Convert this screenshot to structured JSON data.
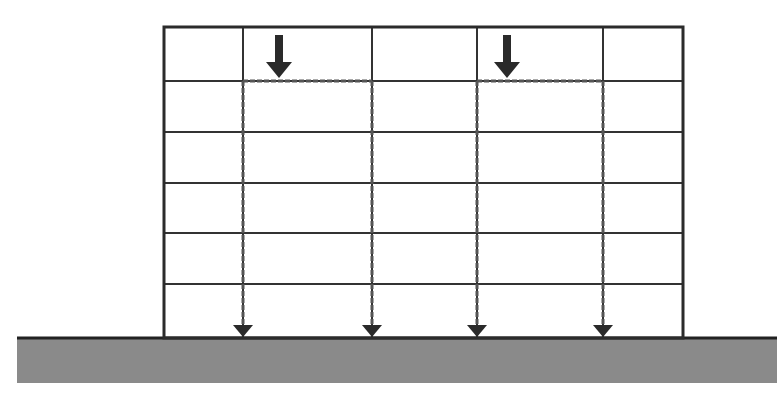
{
  "diagram": {
    "type": "structural-load-path",
    "canvas": {
      "width": 777,
      "height": 393,
      "background": "#ffffff"
    },
    "colors": {
      "frame": "#2b2b2b",
      "grid": "#333333",
      "load_path": "#555555",
      "arrow": "#2a2a2a",
      "ground_fill": "#8a8a8a",
      "ground_edge": "#222222"
    },
    "frame": {
      "left": 164,
      "right": 683,
      "top": 27,
      "bottom": 338,
      "stroke": 3
    },
    "columns_x": [
      243,
      372,
      477,
      603
    ],
    "floors_y": [
      81,
      132,
      183,
      233,
      284
    ],
    "ground": {
      "x": 17,
      "y": 338,
      "width": 760,
      "height": 45,
      "edge": 3
    },
    "top_loads": [
      {
        "x": 279,
        "y_start": 35,
        "y_end": 78,
        "label": "load-arrow-left"
      },
      {
        "x": 507,
        "y_start": 35,
        "y_end": 78,
        "label": "load-arrow-right"
      }
    ],
    "load_paths": [
      {
        "beam_from": 243,
        "beam_to": 372,
        "beam_y": 81
      },
      {
        "beam_from": 477,
        "beam_to": 603,
        "beam_y": 81
      }
    ],
    "support_arrows_x": [
      243,
      372,
      477,
      603
    ]
  }
}
